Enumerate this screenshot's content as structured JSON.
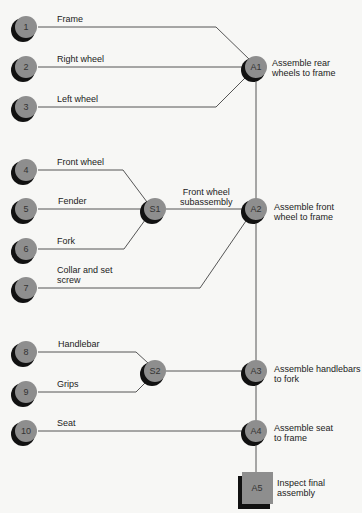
{
  "colors": {
    "background": "#f7f7f5",
    "node_fill": "#8e8e8e",
    "node_shadow": "#111111",
    "line": "#555555",
    "text": "#222222"
  },
  "components": [
    {
      "id": "1",
      "label": "Frame"
    },
    {
      "id": "2",
      "label": "Right wheel"
    },
    {
      "id": "3",
      "label": "Left wheel"
    },
    {
      "id": "4",
      "label": "Front wheel"
    },
    {
      "id": "5",
      "label": "Fender"
    },
    {
      "id": "6",
      "label": "Fork"
    },
    {
      "id": "7",
      "label": "Collar and set",
      "label2": "screw"
    },
    {
      "id": "8",
      "label": "Handlebar"
    },
    {
      "id": "9",
      "label": "Grips"
    },
    {
      "id": "10",
      "label": "Seat"
    }
  ],
  "subassemblies": [
    {
      "id": "S1",
      "label": "Front wheel",
      "label2": "subassembly"
    },
    {
      "id": "S2"
    }
  ],
  "assemblies": [
    {
      "id": "A1",
      "label": "Assemble rear",
      "label2": "wheels to frame"
    },
    {
      "id": "A2",
      "label": "Assemble front",
      "label2": "wheel to frame"
    },
    {
      "id": "A3",
      "label": "Assemble handlebars",
      "label2": "to fork"
    },
    {
      "id": "A4",
      "label": "Assemble seat",
      "label2": "to frame"
    }
  ],
  "inspection": {
    "id": "A5",
    "label": "Inspect final",
    "label2": "assembly"
  }
}
